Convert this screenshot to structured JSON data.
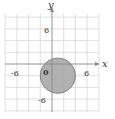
{
  "chart_data": {
    "type": "scatter",
    "title": "",
    "xlabel": "x",
    "ylabel": "y",
    "xlim": [
      -8,
      8
    ],
    "ylim": [
      -8,
      8
    ],
    "grid": true,
    "grid_step": 2,
    "tick_labels": {
      "x": [
        {
          "value": -6,
          "label": "-6"
        },
        {
          "value": 6,
          "label": "6"
        }
      ],
      "y": [
        {
          "value": 6,
          "label": "6"
        },
        {
          "value": -6,
          "label": "-6"
        }
      ],
      "origin": "0"
    },
    "shapes": [
      {
        "kind": "filled-circle",
        "center": [
          1,
          -2
        ],
        "radius": 3,
        "fill": "#a9a9a9",
        "stroke": "#777777"
      }
    ]
  },
  "labels": {
    "x_axis": "x",
    "y_axis": "y",
    "x_neg": "-6",
    "x_pos": "6",
    "y_pos": "6",
    "y_neg": "-6",
    "origin": "0"
  }
}
